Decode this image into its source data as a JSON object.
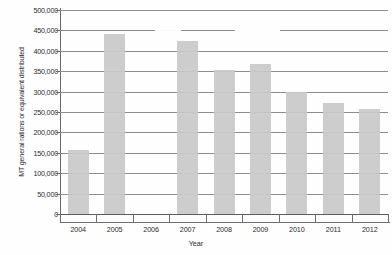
{
  "chart_data": {
    "type": "bar",
    "title": "",
    "xlabel": "Year",
    "ylabel": "MT general rations or equivalent distributed",
    "categories": [
      "2004",
      "2005",
      "2006",
      "2007",
      "2008",
      "2009",
      "2010",
      "2011",
      "2012"
    ],
    "values": [
      156000,
      440000,
      null,
      425000,
      352000,
      368000,
      298000,
      272000,
      258000
    ],
    "ylim": [
      0,
      500000
    ],
    "yticks": [
      0,
      50000,
      100000,
      150000,
      200000,
      250000,
      300000,
      350000,
      400000,
      450000,
      500000
    ],
    "ytick_labels": [
      "0",
      "50,000",
      "100,000",
      "150,000",
      "200,000",
      "250,000",
      "300,000",
      "350,000",
      "400,000",
      "450,000",
      "500,000"
    ],
    "grid": true,
    "legend": false,
    "bar_color": "#c9c9c9",
    "gridline_color": "#8d8d8d",
    "axis_color": "#6a6a6a",
    "background_color": "#ffffff"
  }
}
